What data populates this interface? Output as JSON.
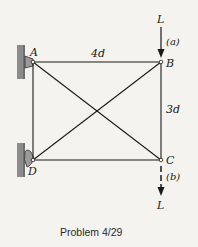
{
  "figure": {
    "caption": "Problem 4/29",
    "background": "#f4f3ef",
    "member_color": "#1a1a1a",
    "wall_color": "#8c8c8c"
  },
  "nodes": {
    "A": {
      "label": "A",
      "x": 33,
      "y": 62
    },
    "B": {
      "label": "B",
      "x": 161,
      "y": 62
    },
    "C": {
      "label": "C",
      "x": 161,
      "y": 160
    },
    "D": {
      "label": "D",
      "x": 33,
      "y": 160
    }
  },
  "members": [
    {
      "from": "A",
      "to": "B"
    },
    {
      "from": "B",
      "to": "C"
    },
    {
      "from": "C",
      "to": "D"
    },
    {
      "from": "D",
      "to": "A"
    },
    {
      "from": "A",
      "to": "C"
    },
    {
      "from": "D",
      "to": "B"
    }
  ],
  "dimensions": {
    "horizontal": "4d",
    "vertical": "3d"
  },
  "loads": {
    "a": {
      "label": "L",
      "case": "(a)",
      "at": "B",
      "direction": "down",
      "style": "solid"
    },
    "b": {
      "label": "L",
      "case": "(b)",
      "at": "C",
      "direction": "down",
      "style": "dashed"
    }
  },
  "supports": {
    "A": "pin-to-wall",
    "D": "pin-to-wall"
  }
}
